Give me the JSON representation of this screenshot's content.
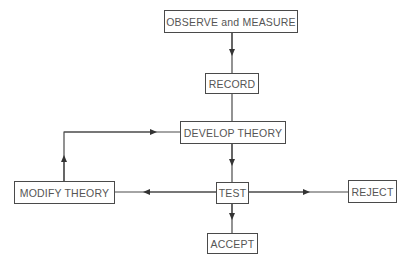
{
  "diagram": {
    "type": "flowchart",
    "nodes": {
      "observe": {
        "label": "OBSERVE and MEASURE"
      },
      "record": {
        "label": "RECORD"
      },
      "develop": {
        "label": "DEVELOP THEORY"
      },
      "test": {
        "label": "TEST"
      },
      "modify": {
        "label": "MODIFY THEORY"
      },
      "reject": {
        "label": "REJECT"
      },
      "accept": {
        "label": "ACCEPT"
      }
    },
    "edges": [
      {
        "from": "OBSERVE and MEASURE",
        "to": "RECORD"
      },
      {
        "from": "RECORD",
        "to": "DEVELOP THEORY"
      },
      {
        "from": "DEVELOP THEORY",
        "to": "TEST"
      },
      {
        "from": "TEST",
        "to": "MODIFY THEORY"
      },
      {
        "from": "TEST",
        "to": "REJECT"
      },
      {
        "from": "TEST",
        "to": "ACCEPT"
      },
      {
        "from": "MODIFY THEORY",
        "to": "DEVELOP THEORY"
      }
    ],
    "colors": {
      "line": "#4a4a4a",
      "text": "#555555",
      "background": "#ffffff"
    }
  }
}
